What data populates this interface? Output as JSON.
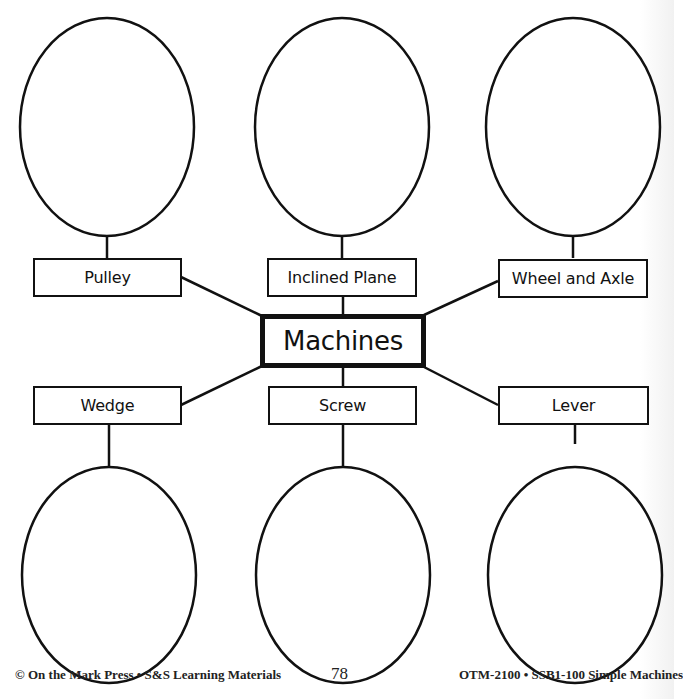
{
  "diagram": {
    "central": {
      "label": "Machines"
    },
    "top_row": [
      {
        "label": "Pulley"
      },
      {
        "label": "Inclined Plane"
      },
      {
        "label": "Wheel and Axle"
      }
    ],
    "bottom_row": [
      {
        "label": "Wedge"
      },
      {
        "label": "Screw"
      },
      {
        "label": "Lever"
      }
    ],
    "answer_ovals": {
      "count": 6,
      "filled": false
    },
    "colors": {
      "line": "#111111",
      "background": "#ffffff"
    }
  },
  "footer": {
    "left": "© On the Mark Press • S&S Learning Materials",
    "page_number": "78",
    "right": "OTM-2100 • SSB1-100 Simple Machines"
  }
}
